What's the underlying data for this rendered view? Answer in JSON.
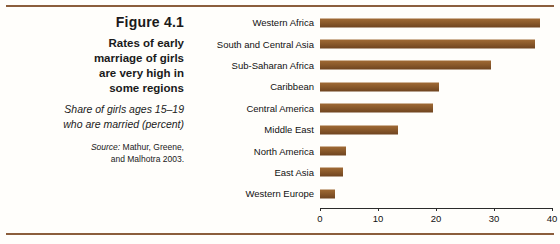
{
  "figure": {
    "number": "Figure 4.1",
    "title_lines": [
      "Rates of early",
      "marriage of girls",
      "are very high in",
      "some regions"
    ],
    "subtitle_lines": [
      "Share of girls ages 15–19",
      "who are married (percent)"
    ],
    "source_lead": "Source:",
    "source_lines": [
      " Mathur, Greene,",
      "and Malhotra 2003."
    ]
  },
  "colors": {
    "bar": "#8b5a2b",
    "rule": "#8b5e3c",
    "axis": "#2b2b2b",
    "background": "#fffefb"
  },
  "chart_data": {
    "type": "bar",
    "orientation": "horizontal",
    "title": "Rates of early marriage of girls are very high in some regions",
    "subtitle": "Share of girls ages 15–19 who are married (percent)",
    "xlabel": "",
    "ylabel": "",
    "xlim": [
      0,
      40
    ],
    "xticks": [
      0,
      10,
      20,
      30,
      40
    ],
    "xtick_labels": [
      "0",
      "10",
      "20",
      "30",
      "40"
    ],
    "grid": false,
    "legend": false,
    "categories": [
      "Western Africa",
      "South and Central Asia",
      "Sub-Saharan Africa",
      "Caribbean",
      "Central America",
      "Middle East",
      "North America",
      "East Asia",
      "Western Europe"
    ],
    "values": [
      38,
      37,
      29.5,
      20.5,
      19.5,
      13.5,
      4.5,
      4,
      2.5
    ],
    "source": "Mathur, Greene, and Malhotra 2003."
  }
}
